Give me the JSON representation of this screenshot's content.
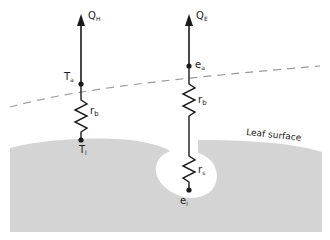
{
  "diagram": {
    "left_column": {
      "flux_label_main": "Q",
      "flux_label_sub": "H",
      "air_node_main": "T",
      "air_node_sub": "a",
      "resistance_main": "r",
      "resistance_sub": "b",
      "leaf_node_main": "T",
      "leaf_node_sub": "l"
    },
    "right_column": {
      "flux_label_main": "Q",
      "flux_label_sub": "E",
      "air_node_main": "e",
      "air_node_sub": "a",
      "boundary_resistance_main": "r",
      "boundary_resistance_sub": "b",
      "stomatal_resistance_main": "r",
      "stomatal_resistance_sub": "s",
      "leaf_node_main": "e",
      "leaf_node_sub": "l"
    },
    "surface_label": "Leaf surface",
    "colors": {
      "leaf_fill": "#d4d4d4",
      "line": "#1a1a1a",
      "boundary_dash": "#9a9a9a"
    }
  }
}
